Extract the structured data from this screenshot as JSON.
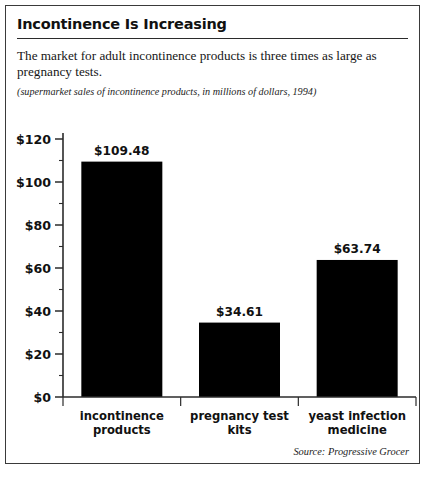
{
  "header": {
    "title": "Incontinence Is Increasing",
    "description": "The market for adult incontinence products is three times as large as pregnancy tests.",
    "caption": "(supermarket sales of incontinence products, in millions of dollars, 1994)"
  },
  "footer": {
    "source": "Source: Progressive Grocer"
  },
  "colors": {
    "bar": "#000000",
    "axis": "#2b2b2b",
    "text": "#111111",
    "frame": "#3a3a3a"
  },
  "chart_data": {
    "type": "bar",
    "title": "Incontinence Is Increasing",
    "subtitle": "The market for adult incontinence products is three times as large as pregnancy tests.",
    "annotation": "(supermarket sales of incontinence products, in millions of dollars, 1994)",
    "source": "Source: Progressive Grocer",
    "xlabel": "",
    "ylabel": "",
    "ylim": [
      0,
      120
    ],
    "grid": false,
    "legend": false,
    "categories": [
      "incontinence products",
      "pregnancy test kits",
      "yeast infection medicine"
    ],
    "category_lines": [
      [
        "incontinence",
        "products"
      ],
      [
        "pregnancy test",
        "kits"
      ],
      [
        "yeast infection",
        "medicine"
      ]
    ],
    "values": [
      109.48,
      34.61,
      63.74
    ],
    "value_labels": [
      "$109.48",
      "$34.61",
      "$63.74"
    ],
    "ytick_values": [
      0,
      20,
      40,
      60,
      80,
      100,
      120
    ],
    "ytick_labels": [
      "$0",
      "$20",
      "$40",
      "$60",
      "$80",
      "$100",
      "$120"
    ],
    "yminor_values": [
      10,
      30,
      50,
      70,
      90,
      110
    ],
    "units": "millions of dollars",
    "year": 1994
  }
}
